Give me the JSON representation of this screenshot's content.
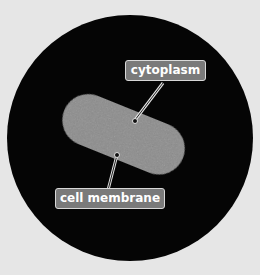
{
  "diagram": {
    "labels": {
      "cytoplasm": "cytoplasm",
      "cell_membrane": "cell membrane"
    },
    "colors": {
      "background": "#e6e6e6",
      "field": "#050505",
      "cell": "#8a8a8a",
      "label_fill": "#7a7a7a",
      "label_border": "#d8d8d8"
    }
  }
}
